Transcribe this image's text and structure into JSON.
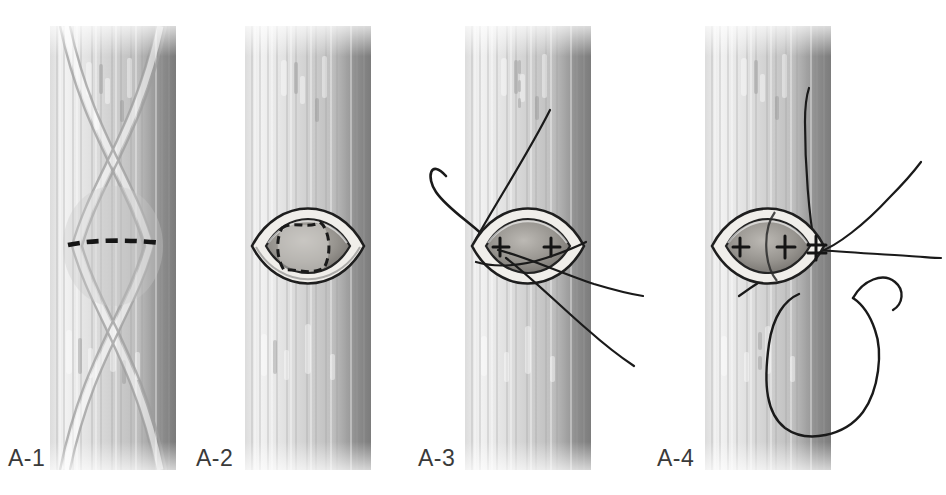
{
  "figure": {
    "background_color": "#ffffff",
    "width": 946,
    "height": 495,
    "label_color": "#3a3a3a",
    "ink_color": "#1a1a1a",
    "tendon_light": "#efefef",
    "tendon_mid": "#b8b8b8",
    "tendon_dark": "#7a7a7a",
    "wound_rim": "#e8e6e2",
    "wound_inner": "#9a9792",
    "wound_deep": "#6d6a66"
  },
  "panels": [
    {
      "id": "a1",
      "label": "A-1",
      "label_x": 8,
      "label_y": 448,
      "caption": "Tendon with crossing fibers and dashed transverse incision line marked",
      "column_x": 50,
      "column_width": 126,
      "features": [
        "tendon-shaft",
        "crossing-fibers",
        "dashed-incision-line"
      ]
    },
    {
      "id": "a2",
      "label": "A-2",
      "label_x": 196,
      "label_y": 448,
      "caption": "Lens-shaped window opened in tendon sheath with dashed inner outline",
      "column_x": 245,
      "column_width": 126,
      "features": [
        "tendon-shaft",
        "elliptical-window",
        "dashed-inner-outline"
      ]
    },
    {
      "id": "a3",
      "label": "A-3",
      "label_x": 418,
      "label_y": 448,
      "caption": "Curved needle passing suture through window, suture strands trailing",
      "column_x": 465,
      "column_width": 126,
      "features": [
        "tendon-shaft",
        "elliptical-window",
        "curved-needle",
        "suture-strands",
        "stitch-marks"
      ]
    },
    {
      "id": "a4",
      "label": "A-4",
      "label_x": 657,
      "label_y": 448,
      "caption": "Sutures placed and tensioned, large suture loop with needle at right",
      "column_x": 705,
      "column_width": 126,
      "features": [
        "tendon-shaft",
        "elliptical-window",
        "stitch-marks",
        "suture-strands",
        "suture-loop",
        "needle"
      ]
    }
  ]
}
